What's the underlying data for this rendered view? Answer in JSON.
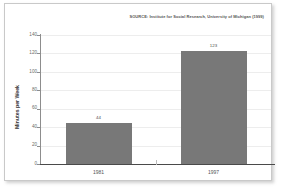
{
  "figure": {
    "source_note": "SOURCE: Institute for Social Research, University of Michigan (1999)",
    "frame_color": "#c9c9c9",
    "background": "#ffffff"
  },
  "chart_data": {
    "type": "bar",
    "title": "",
    "subtitle": "",
    "xlabel": "",
    "ylabel": "Minutes per Week",
    "categories": [
      "1981",
      "1997"
    ],
    "values": [
      44,
      123
    ],
    "value_labels": [
      "44",
      "123"
    ],
    "ylim": [
      0,
      140
    ],
    "yticks": [
      0,
      20,
      40,
      60,
      80,
      100,
      120,
      140
    ],
    "ytick_labels": [
      "0",
      "20",
      "40",
      "60",
      "80",
      "100",
      "120",
      "140"
    ],
    "grid": true,
    "grid_axis": "y",
    "legend": false,
    "legend_position": "none",
    "bar_color": "#787878",
    "annotation": "SOURCE: Institute for Social Research, University of Michigan (1999)"
  }
}
